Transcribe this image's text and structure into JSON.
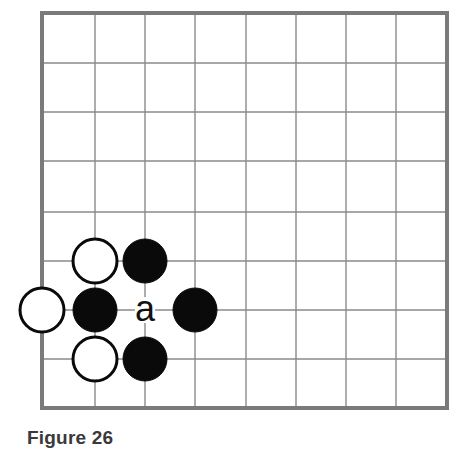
{
  "figure": {
    "caption": "Figure 26"
  },
  "board": {
    "columns": 9,
    "rows": 9,
    "x_lines": [
      42,
      95,
      145,
      195,
      246,
      296,
      346,
      396,
      447
    ],
    "y_lines": [
      13,
      63,
      112,
      161,
      212,
      261,
      310,
      359,
      408
    ],
    "line_color": "#8a8a8a",
    "border_color": "#7a7a7a",
    "stone_radius": 22
  },
  "stones": [
    {
      "color": "white",
      "col": 1,
      "row": 5
    },
    {
      "color": "black",
      "col": 2,
      "row": 5
    },
    {
      "color": "white",
      "col": 0,
      "row": 6
    },
    {
      "color": "black",
      "col": 1,
      "row": 6
    },
    {
      "color": "black",
      "col": 3,
      "row": 6
    },
    {
      "color": "white",
      "col": 1,
      "row": 7
    },
    {
      "color": "black",
      "col": 2,
      "row": 7
    }
  ],
  "markers": [
    {
      "label": "a",
      "col": 2,
      "row": 6
    }
  ]
}
